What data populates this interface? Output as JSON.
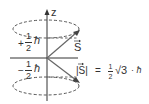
{
  "diagram": {
    "axis_label": "z",
    "vector_label": "S",
    "upper_projection": {
      "sign": "+",
      "num": "1",
      "den": "2",
      "unit": "ħ"
    },
    "lower_projection": {
      "sign": "−",
      "num": "1",
      "den": "2",
      "unit": "ħ"
    },
    "magnitude": {
      "lhs": "|S|",
      "eq": "=",
      "num": "1",
      "den": "2",
      "root": "√3",
      "rest": "· ħ"
    },
    "colors": {
      "line": "#333333",
      "arrow": "#555555"
    }
  }
}
